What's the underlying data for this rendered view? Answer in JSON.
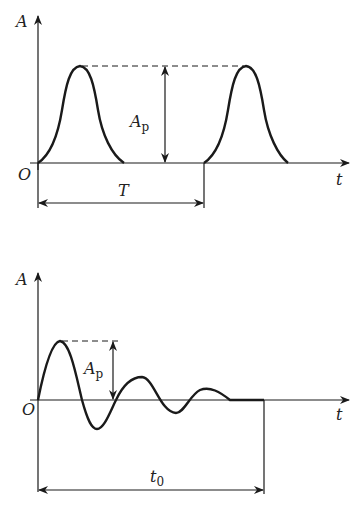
{
  "diagrams": [
    {
      "id": "periodic-pulse",
      "y_axis_label": "A",
      "x_axis_label": "t",
      "origin_label": "O",
      "amplitude_label": "A",
      "amplitude_subscript": "p",
      "period_label": "T",
      "description": "Periodic bell-shaped pulses of peak amplitude Ap and period T"
    },
    {
      "id": "damped-oscillation",
      "y_axis_label": "A",
      "x_axis_label": "t",
      "origin_label": "O",
      "amplitude_label": "A",
      "amplitude_subscript": "p",
      "duration_label": "t",
      "duration_subscript": "0",
      "description": "Decaying oscillation with peak amplitude Ap lasting duration t0"
    }
  ],
  "colors": {
    "line": "#1a1a1a",
    "text": "#222222",
    "background": "#ffffff"
  }
}
